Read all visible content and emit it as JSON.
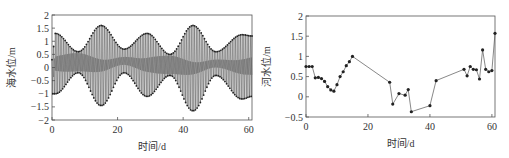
{
  "chart_data": [
    {
      "type": "line",
      "title": "",
      "xlabel": "时间/d",
      "ylabel": "海水位/m",
      "xlim": [
        0,
        61
      ],
      "ylim": [
        -2,
        2
      ],
      "xticks": [
        0,
        20,
        40,
        60
      ],
      "yticks": [
        -2,
        -1.5,
        -1,
        -0.5,
        0,
        0.5,
        1,
        1.5,
        2
      ],
      "ytick_labels": [
        "-2",
        "-1.5",
        "-1",
        "-0.5",
        "0",
        "0.5",
        "1",
        "1.5",
        "2"
      ],
      "grid": false,
      "legend": null,
      "description": "Semi-diurnal tidal oscillation with spring-neap modulation; envelope peaks near day 1, 15, 29, 43, 58",
      "series": [
        {
          "name": "sea level (tidal oscillation)",
          "envelope_upper": {
            "x": [
              0,
              1,
              8,
              15,
              22,
              29,
              36,
              43,
              50,
              58,
              61
            ],
            "y": [
              0.3,
              1.3,
              0.6,
              1.6,
              0.7,
              1.3,
              0.5,
              1.6,
              0.6,
              1.25,
              1.2
            ]
          },
          "envelope_lower": {
            "x": [
              0,
              1,
              8,
              15,
              22,
              29,
              36,
              43,
              50,
              58,
              61
            ],
            "y": [
              -1.0,
              -1.0,
              -0.2,
              -1.45,
              -0.2,
              -1.1,
              -0.3,
              -1.65,
              -0.3,
              -1.2,
              -1.1
            ]
          },
          "period_days": 0.5
        }
      ]
    },
    {
      "type": "line",
      "title": "",
      "xlabel": "时间/d",
      "ylabel": "河水位/m",
      "xlim": [
        0,
        61
      ],
      "ylim": [
        -0.5,
        2
      ],
      "xticks": [
        0,
        20,
        40,
        60
      ],
      "yticks": [
        -0.5,
        0,
        0.5,
        1,
        1.5,
        2
      ],
      "ytick_labels": [
        "-0.5",
        "0",
        "0.5",
        "1",
        "1.5",
        "2"
      ],
      "grid": false,
      "legend": null,
      "series": [
        {
          "name": "river level",
          "marker": "dot",
          "x": [
            0,
            1,
            2,
            3,
            4,
            5,
            6,
            7,
            8,
            9,
            10,
            11,
            12,
            13,
            14,
            15,
            27,
            28,
            30,
            32,
            33,
            34,
            40,
            42,
            51,
            52,
            53,
            54,
            55,
            56,
            57,
            58,
            59,
            60,
            61
          ],
          "y": [
            0.75,
            0.75,
            0.75,
            0.47,
            0.48,
            0.45,
            0.38,
            0.25,
            0.17,
            0.14,
            0.3,
            0.5,
            0.62,
            0.77,
            0.87,
            1.0,
            0.36,
            -0.18,
            0.08,
            0.04,
            0.18,
            -0.37,
            -0.22,
            0.4,
            0.68,
            0.52,
            0.75,
            0.68,
            0.67,
            0.44,
            1.16,
            0.68,
            0.62,
            0.65,
            1.57
          ]
        }
      ]
    }
  ]
}
